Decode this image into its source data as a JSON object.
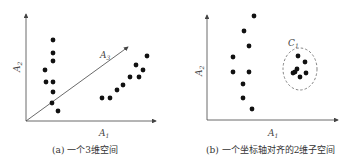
{
  "panels": [
    {
      "id": "a",
      "caption": "(a) 一个3维空间",
      "axes": {
        "x_label": "A",
        "x_sub": "1",
        "y_label": "A",
        "y_sub": "2",
        "z_label": "A",
        "z_sub": "3"
      },
      "points": [
        [
          53,
          40
        ],
        [
          53,
          53
        ],
        [
          53,
          61
        ],
        [
          45,
          70
        ],
        [
          46,
          82
        ],
        [
          53,
          82
        ],
        [
          53,
          92
        ],
        [
          52,
          103
        ],
        [
          58,
          111
        ],
        [
          102,
          98
        ],
        [
          110,
          98
        ],
        [
          117,
          90
        ],
        [
          123,
          85
        ],
        [
          130,
          77
        ],
        [
          136,
          65
        ],
        [
          139,
          77
        ],
        [
          143,
          70
        ],
        [
          147,
          56
        ]
      ]
    },
    {
      "id": "b",
      "caption": "(b) 一个坐标轴对齐的2维子空间",
      "axes": {
        "x_label": "A",
        "x_sub": "1",
        "y_label": "A",
        "y_sub": "2"
      },
      "cluster_label": "C",
      "cluster_sub": "1",
      "points": [
        [
          254,
          16
        ],
        [
          244,
          31
        ],
        [
          249,
          46
        ],
        [
          233,
          57
        ],
        [
          233,
          72
        ],
        [
          249,
          72
        ],
        [
          243,
          84
        ],
        [
          243,
          98
        ],
        [
          252,
          109
        ]
      ],
      "cluster_points": [
        [
          298,
          56
        ],
        [
          305,
          62
        ],
        [
          297,
          69
        ],
        [
          295,
          72
        ],
        [
          306,
          73
        ],
        [
          300,
          77
        ],
        [
          293,
          73
        ]
      ]
    }
  ],
  "colors": {
    "axis": "#444444",
    "point": "#111111",
    "ellipse": "#666666"
  }
}
